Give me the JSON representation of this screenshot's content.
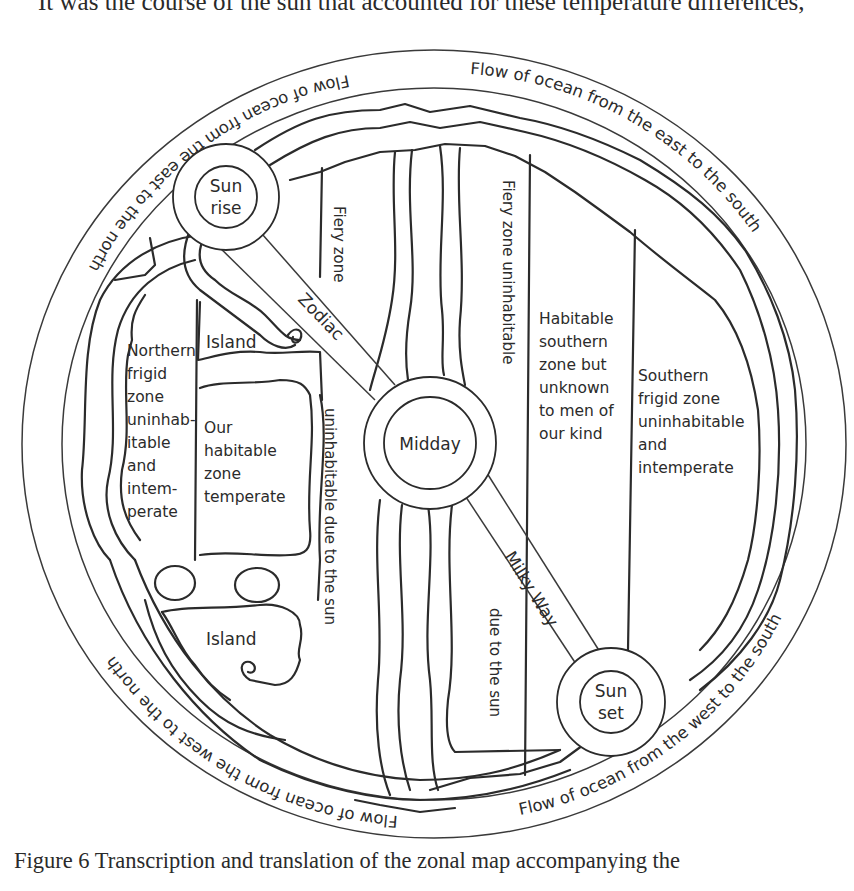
{
  "page": {
    "running_text": "It was the course of the sun that accounted for these temperature differences,",
    "caption": "Figure 6  Transcription and translation of the zonal map accompanying the"
  },
  "diagram": {
    "type": "zonal map (Macrobian world map)",
    "ocean_ring_labels": {
      "top_left": "Flow of ocean from the east to the north",
      "top_right": "Flow of ocean from the east to the south",
      "bottom_left": "Flow of ocean from the west to the north",
      "bottom_right": "Flow of ocean from the west to the south"
    },
    "suns": {
      "sunrise": [
        "Sun",
        "rise"
      ],
      "midday": "Midday",
      "sunset": [
        "Sun",
        "set"
      ]
    },
    "bands": {
      "zodiac": "Zodiac",
      "milky_way": "Milky Way"
    },
    "zones": {
      "fiery_zone": "Fiery zone",
      "fiery_zone_uninhabitable": "Fiery zone uninhabitable",
      "uninhabitable_due_to_sun": "uninhabitable due to the sun",
      "due_to_the_sun": "due to the sun",
      "northern_frigid": [
        "Northern",
        "frigid",
        "zone",
        "uninhab-",
        "itable",
        "and",
        "intem-",
        "perate"
      ],
      "our_habitable": [
        "Our",
        "habitable",
        "zone",
        "temperate"
      ],
      "habitable_southern": [
        "Habitable",
        "southern",
        "zone but",
        "unknown",
        "to men of",
        "our kind"
      ],
      "southern_frigid": [
        "Southern",
        "frigid zone",
        "uninhabitable",
        "and",
        "intemperate"
      ]
    },
    "islands": {
      "upper": "Island",
      "lower": "Island"
    }
  }
}
